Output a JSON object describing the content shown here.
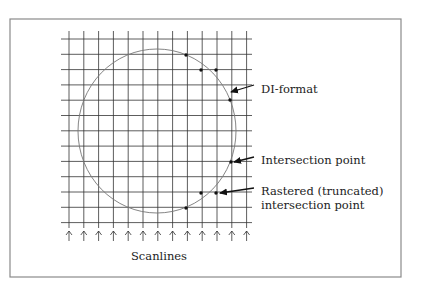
{
  "diagram": {
    "frame": {
      "x": 10,
      "y": 19,
      "w": 391,
      "h": 258,
      "color": "#8a8a8a"
    },
    "grid": {
      "x_lines": [
        69,
        83.8,
        98.6,
        113.4,
        128.2,
        143,
        157.8,
        172.6,
        187.4,
        202.2,
        217,
        231.8,
        246.6
      ],
      "y_lines": [
        39,
        54.3,
        69.6,
        84.9,
        100.2,
        115.5,
        130.8,
        146.1,
        161.4,
        176.7,
        192,
        207.3,
        222.6
      ],
      "x_extent": [
        61,
        252
      ],
      "y_extent": [
        31,
        228
      ],
      "color": "#333333"
    },
    "circle": {
      "cx": 157,
      "cy": 131,
      "rx": 79,
      "ry": 82,
      "color": "#777777"
    },
    "points": [
      {
        "x": 186,
        "y": 55
      },
      {
        "x": 201,
        "y": 70
      },
      {
        "x": 216,
        "y": 70
      },
      {
        "x": 230,
        "y": 100
      },
      {
        "x": 231,
        "y": 162
      },
      {
        "x": 201,
        "y": 193
      },
      {
        "x": 216,
        "y": 193
      },
      {
        "x": 186,
        "y": 208
      }
    ],
    "annotations": [
      {
        "id": "di-format",
        "text": "DI-format",
        "x": 261,
        "y": 93,
        "arrow": {
          "x1": 254,
          "y1": 85,
          "x2": 231,
          "y2": 92
        }
      },
      {
        "id": "intersection",
        "text": "Intersection point",
        "x": 261,
        "y": 164,
        "arrow": {
          "x1": 254,
          "y1": 157,
          "x2": 234,
          "y2": 162
        }
      },
      {
        "id": "rastered",
        "text": "Rastered (truncated)",
        "x": 261,
        "y": 195,
        "arrow": {
          "x1": 254,
          "y1": 188,
          "x2": 220,
          "y2": 193
        }
      },
      {
        "id": "rastered-2",
        "text": "intersection point",
        "x": 261,
        "y": 209
      }
    ],
    "scanlines_label": {
      "text": "Scanlines",
      "x": 159,
      "y": 260
    },
    "scanline_arrows": {
      "y_top": 231,
      "y_bottom": 241
    }
  }
}
